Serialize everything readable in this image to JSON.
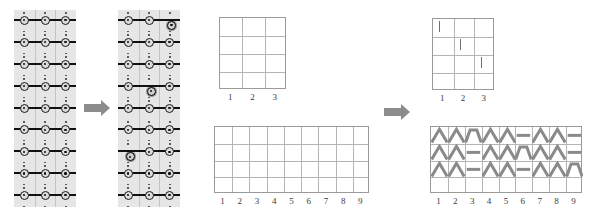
{
  "figure": {
    "background_color": "#ffffff",
    "arrow_color": "#8c8c8c",
    "lattice_bg_color": "#e6e6e6",
    "lattice_line_color": "#111111",
    "grid_line_color": "#b4b4b4",
    "glyph_color": "#8a8a8a"
  },
  "panels": {
    "lattice_before": {
      "name": "lattice-before",
      "columns": 3,
      "rows": 9,
      "defects": []
    },
    "lattice_after": {
      "name": "lattice-after",
      "columns": 3,
      "rows": 9,
      "defects": [
        {
          "row": 1,
          "column": 3
        },
        {
          "row": 4,
          "column": 2
        },
        {
          "row": 7,
          "column": 1
        }
      ]
    }
  },
  "arrows": [
    {
      "name": "arrow-lattice-transform",
      "direction": "right"
    },
    {
      "name": "arrow-grid-transform",
      "direction": "right"
    }
  ],
  "grids": {
    "small_empty": {
      "name": "grid-3x4-empty",
      "columns": 3,
      "rows": 4,
      "column_labels": [
        "1",
        "2",
        "3"
      ],
      "cells": []
    },
    "small_marked": {
      "name": "grid-3x4-marked",
      "columns": 3,
      "rows": 4,
      "column_labels": [
        "1",
        "2",
        "3"
      ],
      "cells": [
        {
          "row": 1,
          "column": 1,
          "mark": "tick"
        },
        {
          "row": 2,
          "column": 2,
          "mark": "tick"
        },
        {
          "row": 3,
          "column": 3,
          "mark": "tick"
        }
      ]
    },
    "large_empty": {
      "name": "grid-9x4-empty",
      "columns": 9,
      "rows": 4,
      "column_labels": [
        "1",
        "2",
        "3",
        "4",
        "5",
        "6",
        "7",
        "8",
        "9"
      ],
      "cells": []
    },
    "large_marked": {
      "name": "grid-9x4-marked",
      "columns": 9,
      "rows": 4,
      "column_labels": [
        "1",
        "2",
        "3",
        "4",
        "5",
        "6",
        "7",
        "8",
        "9"
      ],
      "row_glyphs": [
        [
          "peak",
          "peak",
          "trapezoid",
          "peak",
          "peak",
          "flat",
          "peak",
          "peak",
          "flat"
        ],
        [
          "peak",
          "peak",
          "flat",
          "peak",
          "peak",
          "trapezoid",
          "peak",
          "peak",
          "flat"
        ],
        [
          "peak",
          "peak",
          "flat",
          "peak",
          "peak",
          "flat",
          "peak",
          "peak",
          "trapezoid"
        ],
        [
          "",
          "",
          "",
          "",
          "",
          "",
          "",
          "",
          ""
        ]
      ]
    }
  }
}
